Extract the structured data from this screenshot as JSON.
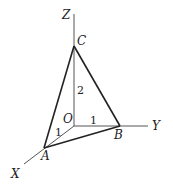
{
  "diagram": {
    "type": "3d-coordinate-tetrahedron",
    "axes": {
      "x_label": "X",
      "y_label": "Y",
      "z_label": "Z"
    },
    "points": {
      "origin": "O",
      "a": "A",
      "b": "B",
      "c": "C"
    },
    "edge_lengths": {
      "OA": "1",
      "OB": "1",
      "OC": "2"
    },
    "colors": {
      "axis": "#555555",
      "edge": "#222222",
      "text": "#222222",
      "background": "#ffffff"
    }
  }
}
